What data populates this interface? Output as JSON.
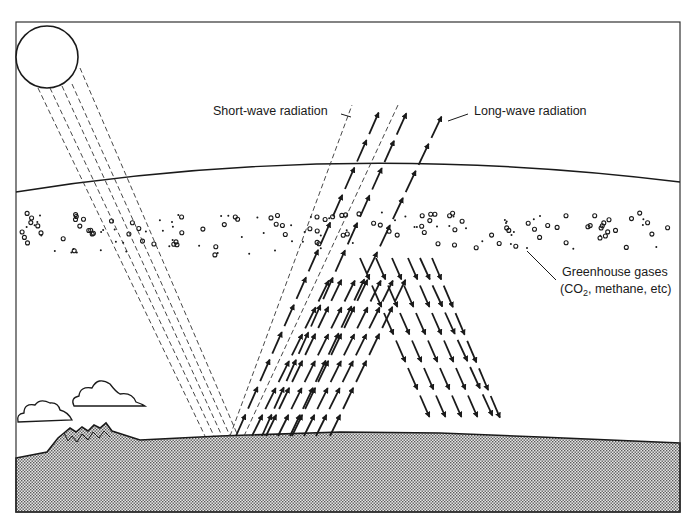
{
  "diagram": {
    "labels": {
      "short_wave": "Short-wave radiation",
      "long_wave": "Long-wave radiation",
      "greenhouse_line1": "Greenhouse gases",
      "greenhouse_co": "(CO",
      "greenhouse_sub": "2",
      "greenhouse_rest": ", methane, etc)"
    },
    "elements": [
      "sun",
      "atmosphere-boundary",
      "greenhouse-gas-particles",
      "short-wave-rays",
      "long-wave-arrows",
      "reflected-arrows",
      "clouds",
      "mountains",
      "ground"
    ],
    "colors": {
      "ink": "#1a1a1a",
      "ground_fill": "#b8b8b8",
      "background": "#ffffff"
    }
  }
}
